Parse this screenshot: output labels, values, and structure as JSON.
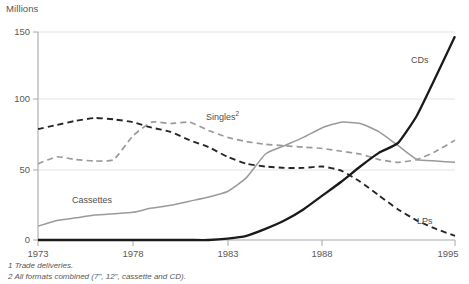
{
  "axis_title": "Millions",
  "footnotes": [
    "1 Trade deliveries.",
    "2 All formats combined (7\", 12\", cassette and CD)."
  ],
  "labels": {
    "cds": "CDs",
    "lps": "LPs",
    "singles": "Singles",
    "singles_sup": "2",
    "cassettes": "Cassettes"
  },
  "chart_data": {
    "type": "line",
    "title": "",
    "subtitle": "",
    "xlabel": "",
    "ylabel": "Millions",
    "ylim": [
      0,
      150
    ],
    "xlim": [
      1973,
      1995
    ],
    "yticks": [
      0,
      50,
      100,
      150
    ],
    "xticks": [
      1973,
      1978,
      1983,
      1988,
      1995
    ],
    "grid": true,
    "legend": "inline-annotations",
    "x": [
      1973,
      1974,
      1975,
      1976,
      1977,
      1978,
      1979,
      1980,
      1981,
      1982,
      1983,
      1984,
      1985,
      1986,
      1987,
      1988,
      1989,
      1990,
      1991,
      1992,
      1993,
      1994,
      1995
    ],
    "series": [
      {
        "name": "LPs",
        "style": "dashed",
        "color": "#262626",
        "values": [
          80,
          83,
          86,
          88,
          87,
          85,
          81,
          78,
          72,
          67,
          60,
          55,
          53,
          52,
          52,
          53,
          50,
          42,
          32,
          22,
          14,
          8,
          3
        ]
      },
      {
        "name": "Singles",
        "style": "dashed",
        "color": "#9a9a9a",
        "values": [
          55,
          60,
          58,
          57,
          58,
          75,
          85,
          84,
          85,
          79,
          74,
          71,
          69,
          68,
          67,
          66,
          64,
          62,
          58,
          56,
          58,
          64,
          72
        ]
      },
      {
        "name": "Cassettes",
        "style": "solid",
        "color": "#9a9a9a",
        "values": [
          10,
          14,
          16,
          18,
          19,
          20,
          23,
          25,
          28,
          31,
          35,
          45,
          62,
          68,
          74,
          81,
          85,
          84,
          78,
          68,
          58,
          57,
          56
        ]
      },
      {
        "name": "CDs",
        "style": "solid",
        "color": "#1a1a1a",
        "values": [
          0,
          0,
          0,
          0,
          0,
          0,
          0,
          0,
          0,
          0,
          1,
          3,
          8,
          14,
          22,
          32,
          42,
          53,
          63,
          70,
          90,
          118,
          147
        ]
      }
    ]
  }
}
